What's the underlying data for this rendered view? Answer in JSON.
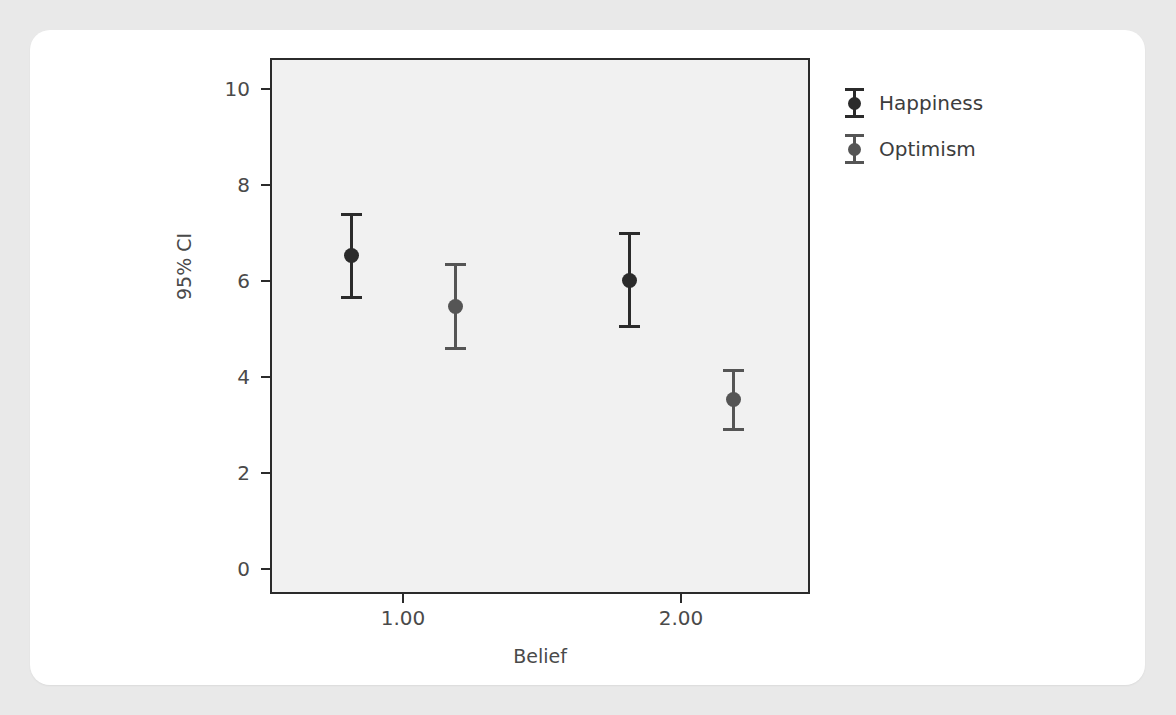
{
  "chart_data": {
    "type": "scatter",
    "title": "",
    "xlabel": "Belief",
    "ylabel": "95% CI",
    "xtick_labels": [
      "1.00",
      "2.00"
    ],
    "x_categories": [
      1.0,
      2.0
    ],
    "ytick_labels": [
      "0",
      "2",
      "4",
      "6",
      "8",
      "10"
    ],
    "yticks": [
      0,
      2,
      4,
      6,
      8,
      10
    ],
    "ylim": [
      -0.55,
      10.7
    ],
    "grid": false,
    "legend_position": "right",
    "series": [
      {
        "name": "Happiness",
        "color": "#2b2b2b",
        "points": [
          {
            "x": 1.0,
            "mean": 6.5,
            "ci_low": 5.6,
            "ci_high": 7.4
          },
          {
            "x": 2.0,
            "mean": 6.0,
            "ci_low": 5.0,
            "ci_high": 7.0
          }
        ]
      },
      {
        "name": "Optimism",
        "color": "#555555",
        "points": [
          {
            "x": 1.0,
            "mean": 5.45,
            "ci_low": 4.55,
            "ci_high": 6.35
          },
          {
            "x": 2.0,
            "mean": 3.5,
            "ci_low": 2.85,
            "ci_high": 4.15
          }
        ]
      }
    ]
  },
  "axes": {
    "y_title": "95% CI",
    "x_title": "Belief",
    "y_labels": [
      "10",
      "8",
      "6",
      "4",
      "2",
      "0"
    ],
    "x_labels": [
      "1.00",
      "2.00"
    ]
  },
  "legend": {
    "items": [
      {
        "label": "Happiness"
      },
      {
        "label": "Optimism"
      }
    ]
  },
  "colors": {
    "page_background": "#e9e9e9",
    "card_background": "#ffffff",
    "plot_background": "#f1f1f1",
    "axis": "#2b2b2b",
    "happiness": "#2b2b2b",
    "optimism": "#555555",
    "tick_text": "#4a4a4a"
  }
}
